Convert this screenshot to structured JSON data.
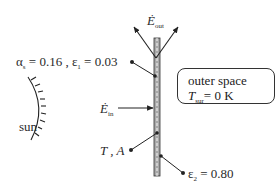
{
  "diagram": {
    "labels": {
      "e_out": {
        "symbol": "Ė",
        "subscript": "out"
      },
      "e_in": {
        "symbol": "Ė",
        "subscript": "in"
      },
      "absorptivity_emissivity_front": {
        "alpha": "α",
        "alpha_sub": "s",
        "alpha_value": "= 0.16 , ",
        "eps": "ε",
        "eps_sub": "1",
        "eps_value": "= 0.03"
      },
      "temperature_area": {
        "text": "T , A"
      },
      "emissivity_back": {
        "eps": "ε",
        "eps_sub": "2",
        "value": "= 0.80"
      },
      "sun": "sun"
    },
    "outer_space_box": {
      "line1": "outer space",
      "T": "T",
      "T_sub": "sur",
      "value": "= 0 K"
    },
    "colors": {
      "line": "#222222",
      "plate_fill": "#9a9a9a",
      "background": "#ffffff"
    }
  }
}
